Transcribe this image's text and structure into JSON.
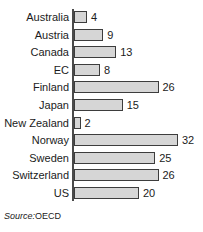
{
  "chart_data": {
    "type": "bar",
    "orientation": "horizontal",
    "title": "",
    "xlabel": "",
    "ylabel": "",
    "categories": [
      "Australia",
      "Austria",
      "Canada",
      "EC",
      "Finland",
      "Japan",
      "New Zealand",
      "Norway",
      "Sweden",
      "Switzerland",
      "US"
    ],
    "values": [
      4,
      9,
      13,
      8,
      26,
      15,
      2,
      32,
      25,
      26,
      20
    ],
    "value_labels": [
      "4",
      "9",
      "13",
      "8",
      "26",
      "15",
      "2",
      "32",
      "25",
      "26",
      "20"
    ],
    "xlim": [
      0,
      32
    ],
    "grid": false,
    "legend": null,
    "bar_fill": "#d6d6d6",
    "bar_border": "#3d3d3d",
    "axis_color": "#4a4a4a",
    "text_color": "#1b1b1b"
  },
  "source": {
    "key": "Source:",
    "value": "OECD"
  }
}
